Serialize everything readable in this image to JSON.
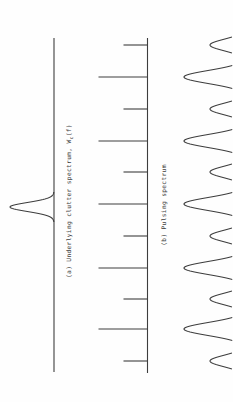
{
  "figure": {
    "background": "#fefefe",
    "line_color": "#3d3d3d",
    "text_color": "#3f3f3f",
    "orientation": "figure rotated 90deg CCW: frequency axes run vertically, amplitudes point left",
    "labels": {
      "a_prefix": "(a) Underlying clutter spectrum, W",
      "a_sub": "c",
      "a_suffix": "(f)",
      "b": "(b) Pulsing spectrum"
    }
  },
  "chart_data": [
    {
      "type": "line",
      "name": "underlying-clutter-spectrum",
      "title": "(a) Underlying clutter spectrum, Wc(f)",
      "description": "Flat baseline with one narrow Gaussian peak at band center",
      "baseline": {
        "x": 54,
        "y_start": 38,
        "y_end": 372
      },
      "peak": {
        "center_y": 207,
        "amplitude": 44,
        "sigma": 4.5,
        "span": 15
      }
    },
    {
      "type": "impulse-train",
      "name": "pulsing-spectrum",
      "title": "(b) Pulsing spectrum",
      "description": "Spectral lines of alternating long/short amplitude, evenly spaced",
      "baseline": {
        "x": 147.5,
        "y_start": 38,
        "y_end": 373
      },
      "short_length": 24,
      "long_length": 49,
      "impulses": [
        {
          "y": 45,
          "size": "short"
        },
        {
          "y": 77,
          "size": "long"
        },
        {
          "y": 109,
          "size": "short"
        },
        {
          "y": 141,
          "size": "long"
        },
        {
          "y": 172,
          "size": "short"
        },
        {
          "y": 204,
          "size": "long"
        },
        {
          "y": 236,
          "size": "short"
        },
        {
          "y": 268,
          "size": "long"
        },
        {
          "y": 299,
          "size": "short"
        },
        {
          "y": 329,
          "size": "long"
        },
        {
          "y": 361,
          "size": "short"
        }
      ]
    },
    {
      "type": "line",
      "name": "pulsed-clutter-spectrum-peaks",
      "description": "Gaussian peaks of alternating tall/small amplitude aligned with pulsing lines; baseline lies beyond right image edge (cut off)",
      "baseline_x_offscreen": 245,
      "clip_x": 233,
      "small": {
        "amplitude": 35,
        "sigma": 5.7,
        "span": 30
      },
      "tall": {
        "amplitude": 61,
        "sigma": 6.5,
        "span": 30
      },
      "peaks": [
        {
          "y": 45,
          "size": "small"
        },
        {
          "y": 77,
          "size": "tall"
        },
        {
          "y": 109,
          "size": "small"
        },
        {
          "y": 141,
          "size": "tall"
        },
        {
          "y": 172,
          "size": "small"
        },
        {
          "y": 204,
          "size": "tall"
        },
        {
          "y": 236,
          "size": "small"
        },
        {
          "y": 268,
          "size": "tall"
        },
        {
          "y": 299,
          "size": "small"
        },
        {
          "y": 329,
          "size": "tall"
        },
        {
          "y": 361,
          "size": "small"
        }
      ]
    }
  ]
}
